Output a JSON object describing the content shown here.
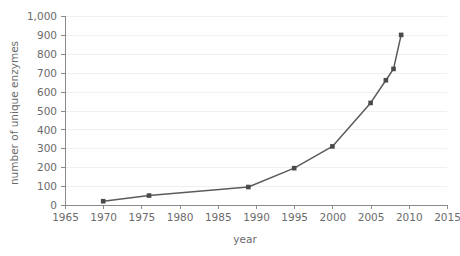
{
  "chart_data": {
    "type": "line",
    "title": "",
    "xlabel": "year",
    "ylabel": "number of unique enzymes",
    "xlim": [
      1965,
      2015
    ],
    "ylim": [
      0,
      1000
    ],
    "xticks": [
      1965,
      1970,
      1975,
      1980,
      1985,
      1990,
      1995,
      2000,
      2005,
      2010,
      2015
    ],
    "xtick_labels": [
      "1965",
      "1970",
      "1975",
      "1980",
      "1985",
      "1990",
      "1995",
      "2000",
      "2005",
      "2010",
      "2015"
    ],
    "yticks": [
      0,
      100,
      200,
      300,
      400,
      500,
      600,
      700,
      800,
      900,
      1000
    ],
    "ytick_labels": [
      "0",
      "100",
      "200",
      "300",
      "400",
      "500",
      "600",
      "700",
      "800",
      "900",
      "1,000"
    ],
    "grid": "horizontal",
    "legend": "none",
    "series": [
      {
        "name": "unique enzymes",
        "color": "#5b5b5b",
        "marker": "square",
        "x": [
          1970,
          1976,
          1989,
          1995,
          2000,
          2005,
          2007,
          2008,
          2009
        ],
        "values": [
          20,
          50,
          95,
          195,
          310,
          540,
          660,
          720,
          900
        ],
        "points": [
          {
            "x": 1970,
            "y": 20
          },
          {
            "x": 1976,
            "y": 50
          },
          {
            "x": 1989,
            "y": 95
          },
          {
            "x": 1995,
            "y": 195
          },
          {
            "x": 2000,
            "y": 310
          },
          {
            "x": 2005,
            "y": 540
          },
          {
            "x": 2007,
            "y": 660
          },
          {
            "x": 2008,
            "y": 720
          },
          {
            "x": 2009,
            "y": 900
          }
        ]
      }
    ]
  },
  "colors": {
    "line": "#5b5b5b",
    "marker": "#4a4a4a",
    "grid": "#f0f0f0",
    "axis": "#8a8a8a",
    "text": "#6b6b6b",
    "background": "#ffffff"
  }
}
